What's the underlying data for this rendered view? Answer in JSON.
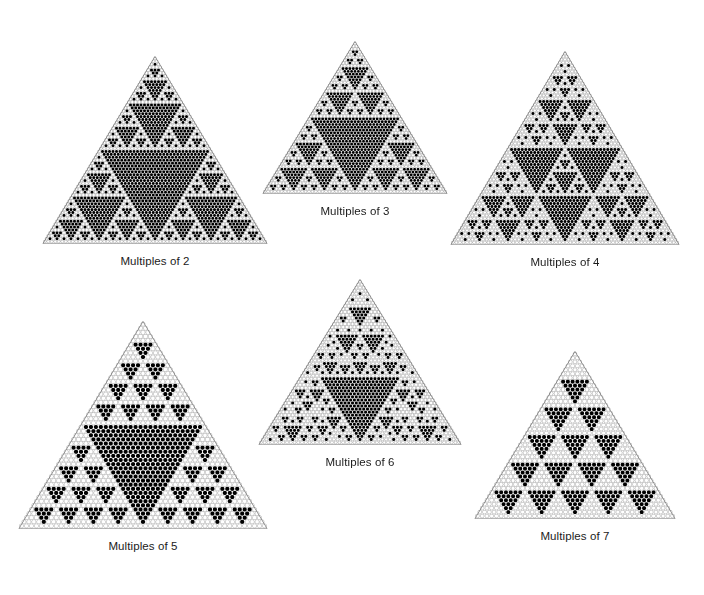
{
  "figure": {
    "background_color": "#ffffff",
    "cell_fill_color": "#000000",
    "cell_empty_color": "#ffffff",
    "cell_stroke_color": "#9a9a9a",
    "label_color": "#1b1b1b",
    "width": 704,
    "height": 595
  },
  "chart_data": {
    "type": "heatmap",
    "xlabel": "",
    "ylabel": "",
    "grid": false,
    "legend": "none",
    "panels": [
      {
        "id": "multiples-of-2",
        "label": "Multiples of 2",
        "modulus": 2,
        "rows": 64,
        "apex_x": 155,
        "apex_y": 57,
        "base_y": 243,
        "half_width": 112
      },
      {
        "id": "multiples-of-3",
        "label": "Multiples of 3",
        "modulus": 3,
        "rows": 54,
        "apex_x": 355,
        "apex_y": 42,
        "base_y": 193,
        "half_width": 92
      },
      {
        "id": "multiples-of-4",
        "label": "Multiples of 4",
        "modulus": 4,
        "rows": 64,
        "apex_x": 565,
        "apex_y": 52,
        "base_y": 244,
        "half_width": 114
      },
      {
        "id": "multiples-of-5",
        "label": "Multiples of 5",
        "modulus": 5,
        "rows": 50,
        "apex_x": 143,
        "apex_y": 322,
        "base_y": 528,
        "half_width": 124
      },
      {
        "id": "multiples-of-6",
        "label": "Multiples of 6",
        "modulus": 6,
        "rows": 54,
        "apex_x": 360,
        "apex_y": 280,
        "base_y": 444,
        "half_width": 101
      },
      {
        "id": "multiples-of-7",
        "label": "Multiples of 7",
        "modulus": 7,
        "rows": 42,
        "apex_x": 575,
        "apex_y": 352,
        "base_y": 518,
        "half_width": 100
      }
    ]
  }
}
